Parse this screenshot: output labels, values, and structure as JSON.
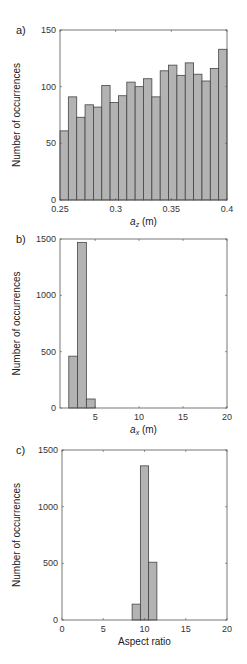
{
  "chart_data": [
    {
      "type": "bar",
      "panel_label": "a)",
      "title": "",
      "xlabel": "a_z (m)",
      "xlabel_main": "a",
      "xlabel_sub": "z",
      "xlabel_unit": " (m)",
      "ylabel": "Number of occurrences",
      "xlim": [
        0.25,
        0.4
      ],
      "ylim": [
        0,
        150
      ],
      "xticks": [
        0.25,
        0.3,
        0.35,
        0.4
      ],
      "xtick_labels": [
        "0.25",
        "0.3",
        "0.35",
        "0.4"
      ],
      "yticks": [
        0,
        50,
        100,
        150
      ],
      "ytick_labels": [
        "0",
        "50",
        "100",
        "150"
      ],
      "grid": false,
      "bin_edges_start": 0.25,
      "bin_width": 0.0075,
      "values": [
        61,
        91,
        73,
        84,
        82,
        101,
        86,
        92,
        104,
        100,
        107,
        91,
        114,
        119,
        110,
        121,
        111,
        105,
        116,
        133
      ]
    },
    {
      "type": "bar",
      "panel_label": "b)",
      "title": "",
      "xlabel": "a_x (m)",
      "xlabel_main": "a",
      "xlabel_sub": "x",
      "xlabel_unit": " (m)",
      "ylabel": "Number of occurrences",
      "xlim": [
        1,
        20
      ],
      "ylim": [
        0,
        1500
      ],
      "xticks": [
        5,
        10,
        15,
        20
      ],
      "xtick_labels": [
        "5",
        "10",
        "15",
        "20"
      ],
      "yticks": [
        0,
        500,
        1000,
        1500
      ],
      "ytick_labels": [
        "0",
        "500",
        "1000",
        "1500"
      ],
      "grid": false,
      "bin_edges_start": 2,
      "bin_width": 1,
      "values": [
        460,
        1470,
        80
      ]
    },
    {
      "type": "bar",
      "panel_label": "c)",
      "title": "",
      "xlabel": "Aspect ratio",
      "xlabel_main": "Aspect ratio",
      "xlabel_sub": "",
      "xlabel_unit": "",
      "ylabel": "Number of occurrences",
      "xlim": [
        0,
        20
      ],
      "ylim": [
        0,
        1500
      ],
      "xticks": [
        0,
        5,
        10,
        15,
        20
      ],
      "xtick_labels": [
        "0",
        "5",
        "10",
        "15",
        "20"
      ],
      "yticks": [
        0,
        500,
        1000,
        1500
      ],
      "ytick_labels": [
        "0",
        "500",
        "1000",
        "1500"
      ],
      "grid": false,
      "bin_edges_start": 8.5,
      "bin_width": 1,
      "values": [
        140,
        1360,
        510
      ]
    }
  ],
  "layout": {
    "panels": [
      {
        "left": 60,
        "top": 30,
        "right": 227,
        "bottom": 200
      },
      {
        "left": 60,
        "top": 239,
        "right": 227,
        "bottom": 408
      },
      {
        "left": 62,
        "top": 450,
        "right": 227,
        "bottom": 620
      }
    ]
  }
}
